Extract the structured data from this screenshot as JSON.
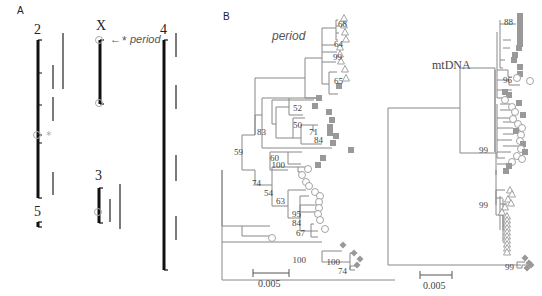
{
  "panels": {
    "A": {
      "label": "A",
      "chromosomes": [
        {
          "name": "2",
          "x": 38,
          "y1": 40,
          "y2": 198,
          "label_y": 34,
          "ticks": [
            73,
            105,
            135,
            143
          ],
          "circle_y": 135,
          "asterisk": true
        },
        {
          "name": "X",
          "x": 100,
          "y1": 40,
          "y2": 104,
          "label_y": 30,
          "ticks": [],
          "circle_y": 103,
          "top_circle": true
        },
        {
          "name": "4",
          "x": 164,
          "y1": 40,
          "y2": 270,
          "label_y": 34,
          "ticks": []
        },
        {
          "name": "3",
          "x": 99,
          "y1": 188,
          "y2": 223,
          "label_y": 180,
          "ticks": [],
          "circle_y": 212
        },
        {
          "name": "5",
          "x": 38,
          "y1": 222,
          "y2": 227,
          "label_y": 216,
          "ticks": []
        }
      ],
      "segments": [
        {
          "x": 63,
          "y1": 33,
          "y2": 89
        },
        {
          "x": 53,
          "y1": 65,
          "y2": 89
        },
        {
          "x": 53,
          "y1": 97,
          "y2": 121
        },
        {
          "x": 53,
          "y1": 172,
          "y2": 195
        },
        {
          "x": 176,
          "y1": 33,
          "y2": 57
        },
        {
          "x": 176,
          "y1": 85,
          "y2": 109
        },
        {
          "x": 176,
          "y1": 155,
          "y2": 181
        },
        {
          "x": 176,
          "y1": 216,
          "y2": 240
        },
        {
          "x": 110,
          "y1": 199,
          "y2": 222
        },
        {
          "x": 120,
          "y1": 184,
          "y2": 229
        }
      ],
      "period_annotation": {
        "arrow": "←",
        "asterisk": "*",
        "text": "period"
      }
    },
    "B": {
      "label": "B",
      "period_tree": {
        "title": "period",
        "scale_bar": {
          "label": "0.005",
          "x1": 253,
          "x2": 289,
          "y": 273
        },
        "bootstrap": [
          {
            "v": "68",
            "x": 347,
            "y": 27
          },
          {
            "v": "64",
            "x": 343,
            "y": 47
          },
          {
            "v": "99",
            "x": 342,
            "y": 60
          },
          {
            "v": "65",
            "x": 343,
            "y": 84
          },
          {
            "v": "52",
            "x": 302,
            "y": 111
          },
          {
            "v": "50",
            "x": 302,
            "y": 128
          },
          {
            "v": "71",
            "x": 318,
            "y": 135
          },
          {
            "v": "84",
            "x": 323,
            "y": 143
          },
          {
            "v": "83",
            "x": 266,
            "y": 135
          },
          {
            "v": "60",
            "x": 279,
            "y": 161
          },
          {
            "v": "59",
            "x": 243,
            "y": 155
          },
          {
            "v": "100",
            "x": 285,
            "y": 168
          },
          {
            "v": "74",
            "x": 261,
            "y": 186
          },
          {
            "v": "54",
            "x": 273,
            "y": 196
          },
          {
            "v": "63",
            "x": 285,
            "y": 204
          },
          {
            "v": "95",
            "x": 301,
            "y": 217
          },
          {
            "v": "84",
            "x": 301,
            "y": 226
          },
          {
            "v": "67",
            "x": 305,
            "y": 236
          },
          {
            "v": "100",
            "x": 306,
            "y": 263
          },
          {
            "v": "100",
            "x": 340,
            "y": 265
          },
          {
            "v": "74",
            "x": 347,
            "y": 274
          }
        ]
      },
      "mtdna_tree": {
        "title": "mtDNA",
        "scale_bar": {
          "label": "0.005",
          "x1": 420,
          "x2": 452,
          "y": 275
        },
        "bootstrap": [
          {
            "v": "88",
            "x": 513,
            "y": 25
          },
          {
            "v": "96",
            "x": 512,
            "y": 83
          },
          {
            "v": "99",
            "x": 488,
            "y": 153
          },
          {
            "v": "99",
            "x": 488,
            "y": 208
          },
          {
            "v": "99",
            "x": 514,
            "y": 270
          }
        ]
      }
    }
  },
  "legend_symbols": {
    "triangle": "open-triangle",
    "square": "filled-square",
    "circle": "open-circle",
    "diamond": "filled-diamond"
  },
  "colors": {
    "chromosome": "#111111",
    "segment": "#333333",
    "branch": "#888888",
    "symbol_fill": "#999999",
    "symbol_stroke": "#999999"
  }
}
